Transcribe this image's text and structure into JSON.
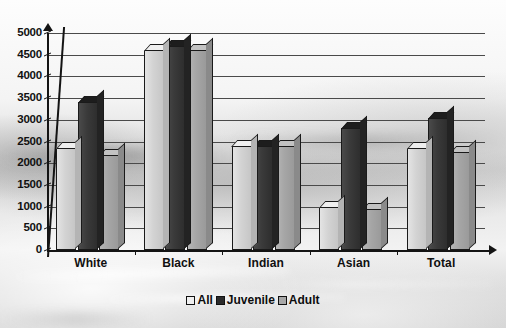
{
  "chart_data": {
    "type": "bar",
    "title": "",
    "xlabel": "",
    "ylabel": "",
    "ylim": [
      0,
      5000
    ],
    "ytick_step": 500,
    "yticks": [
      "5000",
      "4500",
      "4000",
      "3500",
      "3000",
      "2500",
      "2000",
      "1500",
      "1000",
      "500",
      "0"
    ],
    "grid": true,
    "legend_position": "bottom",
    "style": "3d-bar",
    "categories": [
      "White",
      "Black",
      "Indian",
      "Asian",
      "Total"
    ],
    "series": [
      {
        "name": "All",
        "color": "#d3d3d3",
        "values": [
          2350,
          4600,
          2400,
          1000,
          2350
        ]
      },
      {
        "name": "Juvenile",
        "color": "#3a3a3a",
        "values": [
          3400,
          4700,
          2400,
          2800,
          3050
        ]
      },
      {
        "name": "Adult",
        "color": "#a6a6a6",
        "values": [
          2200,
          4600,
          2400,
          950,
          2250
        ]
      }
    ]
  },
  "legend": {
    "items": [
      {
        "label": "All",
        "swatch": "legend-swatch-all"
      },
      {
        "label": "Juvenile",
        "swatch": "legend-swatch-juvenile"
      },
      {
        "label": "Adult",
        "swatch": "legend-swatch-adult"
      }
    ]
  },
  "axes": {
    "y_max_label": "5000",
    "y_min_label": "0"
  }
}
